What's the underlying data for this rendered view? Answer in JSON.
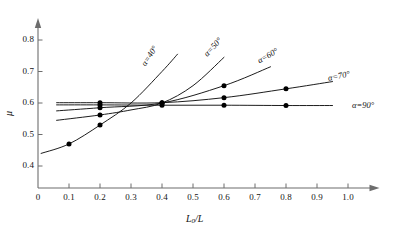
{
  "chart_data": {
    "type": "line",
    "title": "",
    "xlabel": "L0/L",
    "ylabel": "mu",
    "xlim": [
      0,
      1.05
    ],
    "ylim": [
      0.33,
      0.85
    ],
    "grid": false,
    "legend": "inline-curve-labels",
    "xticks": [
      "0",
      "0.1",
      "0.2",
      "0.3",
      "0.4",
      "0.5",
      "0.6",
      "0.7",
      "0.8",
      "0.9",
      "1.0"
    ],
    "xtick_values": [
      0,
      0.1,
      0.2,
      0.3,
      0.4,
      0.5,
      0.6,
      0.7,
      0.8,
      0.9,
      1.0
    ],
    "yticks": [
      "0.4",
      "0.5",
      "0.6",
      "0.7",
      "0.8"
    ],
    "ytick_values": [
      0.4,
      0.5,
      0.6,
      0.7,
      0.8
    ],
    "series": [
      {
        "name": "alpha=40",
        "label": "α=40°",
        "label_rotation": -57,
        "x": [
          0.01,
          0.1,
          0.2,
          0.3,
          0.4,
          0.45
        ],
        "values": [
          0.44,
          0.47,
          0.53,
          0.6,
          0.7,
          0.755
        ],
        "markers_x": [
          0.1,
          0.2
        ],
        "markers_y": [
          0.47,
          0.53
        ]
      },
      {
        "name": "alpha=50",
        "label": "α=50°",
        "label_rotation": -47,
        "x": [
          0.06,
          0.2,
          0.3,
          0.4,
          0.5,
          0.6
        ],
        "values": [
          0.545,
          0.562,
          0.578,
          0.6,
          0.655,
          0.745
        ],
        "markers_x": [
          0.2,
          0.4
        ],
        "markers_y": [
          0.562,
          0.6
        ]
      },
      {
        "name": "alpha=60",
        "label": "α=60°",
        "label_rotation": -30,
        "x": [
          0.06,
          0.2,
          0.4,
          0.6,
          0.75
        ],
        "values": [
          0.575,
          0.585,
          0.6,
          0.655,
          0.715
        ],
        "markers_x": [
          0.2,
          0.4,
          0.6
        ],
        "markers_y": [
          0.585,
          0.6,
          0.655
        ]
      },
      {
        "name": "alpha=70",
        "label": "α=70°",
        "label_rotation": -12,
        "x": [
          0.06,
          0.2,
          0.4,
          0.6,
          0.8,
          0.95
        ],
        "values": [
          0.601,
          0.601,
          0.601,
          0.617,
          0.645,
          0.668
        ],
        "markers_x": [
          0.2,
          0.4,
          0.6,
          0.8
        ],
        "markers_y": [
          0.601,
          0.601,
          0.617,
          0.645
        ]
      },
      {
        "name": "alpha=90",
        "label": "α=90°",
        "label_rotation": 0,
        "x": [
          0.06,
          0.2,
          0.4,
          0.6,
          0.8,
          0.95
        ],
        "values": [
          0.594,
          0.594,
          0.593,
          0.593,
          0.592,
          0.592
        ],
        "markers_x": [
          0.2,
          0.4,
          0.6,
          0.8
        ],
        "markers_y": [
          0.594,
          0.593,
          0.593,
          0.592
        ]
      }
    ]
  },
  "axes": {
    "x_title_main": "L",
    "x_title_sub": "0",
    "x_title_tail": "/L",
    "y_title": "μ"
  }
}
